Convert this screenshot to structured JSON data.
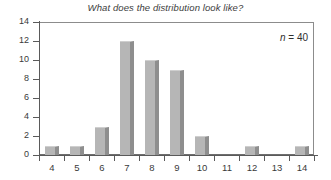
{
  "chart_data": {
    "type": "bar",
    "title": "What does the distribution look like?",
    "xlabel": "",
    "ylabel": "",
    "categories": [
      "4",
      "5",
      "6",
      "7",
      "8",
      "9",
      "10",
      "11",
      "12",
      "13",
      "14"
    ],
    "values": [
      1,
      1,
      3,
      12,
      10,
      9,
      2,
      0,
      1,
      0,
      1
    ],
    "ylim": [
      0,
      14
    ],
    "y_ticks": [
      0,
      2,
      4,
      6,
      8,
      10,
      12,
      14
    ],
    "y_tick_labels": [
      "0",
      "2",
      "4",
      "6",
      "8",
      "10",
      "12",
      "14"
    ],
    "grid": false,
    "legend": null,
    "annotations": [
      {
        "text": "n = 40",
        "symbol": "n",
        "value": "40",
        "position": "top-right"
      }
    ],
    "bar_face_color": "#b6b6b6",
    "bar_shadow_color": "#8e8e8e",
    "axis_color": "#5a5a5a",
    "background_color": "#ffffff"
  }
}
